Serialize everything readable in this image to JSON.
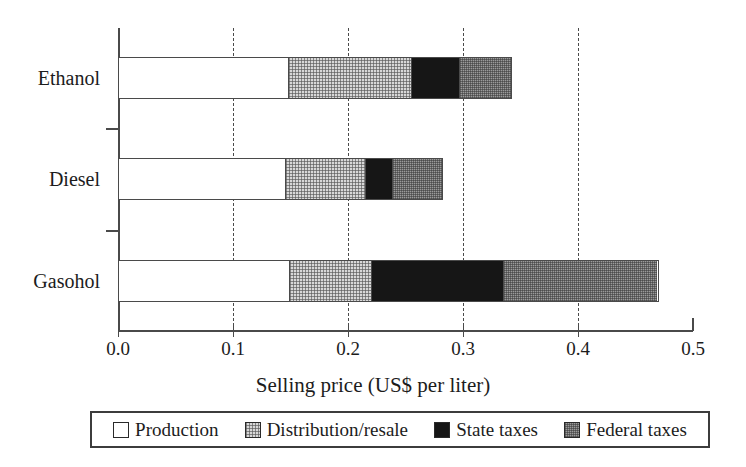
{
  "chart_data": {
    "type": "bar",
    "orientation": "horizontal",
    "stacked": true,
    "title": "",
    "xlabel": "Selling price (US$ per liter)",
    "ylabel": "",
    "categories": [
      "Ethanol",
      "Diesel",
      "Gasohol"
    ],
    "series": [
      {
        "name": "Production",
        "color": "#ffffff",
        "values": [
          0.148,
          0.145,
          0.148
        ]
      },
      {
        "name": "Distribution/resale",
        "color": "#d8d8d8",
        "values": [
          0.107,
          0.07,
          0.072
        ]
      },
      {
        "name": "State taxes",
        "color": "#161616",
        "values": [
          0.042,
          0.024,
          0.115
        ]
      },
      {
        "name": "Federal taxes",
        "color": "#9b9b9b",
        "values": [
          0.046,
          0.044,
          0.135
        ]
      }
    ],
    "totals": [
      0.343,
      0.283,
      0.47
    ],
    "xlim": [
      0.0,
      0.5
    ],
    "xticks": [
      0.0,
      0.1,
      0.2,
      0.3,
      0.4,
      0.5
    ],
    "xticklabels": [
      "0.0",
      "0.1",
      "0.2",
      "0.3",
      "0.4",
      "0.5"
    ],
    "grid": "vertical-dashed",
    "legend_position": "bottom"
  },
  "axis": {
    "x_title": "Selling price (US$ per liter)",
    "tick_labels": [
      "0.0",
      "0.1",
      "0.2",
      "0.3",
      "0.4",
      "0.5"
    ],
    "category_labels": [
      "Ethanol",
      "Diesel",
      "Gasohol"
    ]
  },
  "legend": {
    "items": [
      {
        "label": "Production",
        "swatch": "swatch-white-icon"
      },
      {
        "label": "Distribution/resale",
        "swatch": "swatch-light-dotted-icon"
      },
      {
        "label": "State taxes",
        "swatch": "swatch-black-icon"
      },
      {
        "label": "Federal taxes",
        "swatch": "swatch-gray-icon"
      }
    ]
  }
}
